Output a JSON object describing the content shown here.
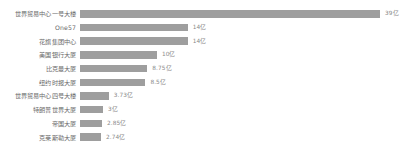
{
  "chart_data": {
    "type": "bar",
    "orientation": "horizontal",
    "title": "",
    "subtitle": "",
    "xlabel": "",
    "ylabel": "",
    "grid": false,
    "legend": false,
    "unit": "亿",
    "xlim": [
      0,
      39
    ],
    "bar_color": "#9e9e9e",
    "categories": [
      "世界贸易中心一号大楼",
      "One57",
      "花旗集团中心",
      "美国银行大厦",
      "比克曼大厦",
      "纽约时报大厦",
      "世界贸易中心四号大楼",
      "特朗普世界大厦",
      "帝国大厦",
      "克莱斯勒大厦"
    ],
    "values": [
      39,
      14,
      14,
      10,
      8.75,
      8.5,
      3.73,
      3,
      2.85,
      2.74
    ],
    "value_labels": [
      "39亿",
      "14亿",
      "14亿",
      "10亿",
      "8.75亿",
      "8.5亿",
      "3.73亿",
      "3亿",
      "2.85亿",
      "2.74亿"
    ]
  }
}
